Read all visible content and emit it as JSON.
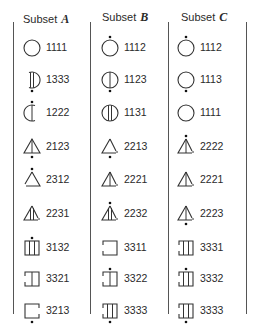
{
  "columns": [
    {
      "label": "Subset",
      "letter": "A",
      "x": 22,
      "items": [
        {
          "code": "1111",
          "shape": "circle",
          "lines": 0,
          "dot": "none",
          "gap": "none"
        },
        {
          "code": "1333",
          "shape": "circle",
          "lines": 2,
          "dot": "bottom",
          "gap": "left"
        },
        {
          "code": "1222",
          "shape": "circle",
          "lines": 1,
          "dot": "top",
          "gap": "right"
        },
        {
          "code": "2123",
          "shape": "triangle",
          "lines": 1,
          "dot": "bottom",
          "gap": "none"
        },
        {
          "code": "2312",
          "shape": "triangle",
          "lines": 0,
          "dot": "top",
          "gap": "left"
        },
        {
          "code": "2231",
          "shape": "triangle",
          "lines": 2,
          "dot": "none",
          "gap": "right"
        },
        {
          "code": "3132",
          "shape": "square",
          "lines": 2,
          "dot": "top",
          "gap": "none"
        },
        {
          "code": "3321",
          "shape": "square",
          "lines": 1,
          "dot": "none",
          "gap": "left"
        },
        {
          "code": "3213",
          "shape": "square",
          "lines": 0,
          "dot": "bottom",
          "gap": "right"
        }
      ]
    },
    {
      "label": "Subset",
      "letter": "B",
      "x": 100,
      "items": [
        {
          "code": "1112",
          "shape": "circle",
          "lines": 0,
          "dot": "top",
          "gap": "none"
        },
        {
          "code": "1123",
          "shape": "circle",
          "lines": 1,
          "dot": "bottom",
          "gap": "none"
        },
        {
          "code": "1131",
          "shape": "circle",
          "lines": 2,
          "dot": "none",
          "gap": "none"
        },
        {
          "code": "2213",
          "shape": "triangle",
          "lines": 0,
          "dot": "bottom",
          "gap": "right"
        },
        {
          "code": "2221",
          "shape": "triangle",
          "lines": 1,
          "dot": "none",
          "gap": "right"
        },
        {
          "code": "2232",
          "shape": "triangle",
          "lines": 2,
          "dot": "top",
          "gap": "right"
        },
        {
          "code": "3311",
          "shape": "square",
          "lines": 0,
          "dot": "none",
          "gap": "left"
        },
        {
          "code": "3322",
          "shape": "square",
          "lines": 1,
          "dot": "top",
          "gap": "left"
        },
        {
          "code": "3333",
          "shape": "square",
          "lines": 2,
          "dot": "bottom",
          "gap": "left"
        }
      ]
    },
    {
      "label": "Subset",
      "letter": "C",
      "x": 176,
      "items": [
        {
          "code": "1112",
          "shape": "circle",
          "lines": 0,
          "dot": "top",
          "gap": "none"
        },
        {
          "code": "1113",
          "shape": "circle",
          "lines": 0,
          "dot": "bottom",
          "gap": "none"
        },
        {
          "code": "1111",
          "shape": "circle",
          "lines": 0,
          "dot": "none",
          "gap": "none"
        },
        {
          "code": "2222",
          "shape": "triangle",
          "lines": 1,
          "dot": "top",
          "gap": "right"
        },
        {
          "code": "2221",
          "shape": "triangle",
          "lines": 1,
          "dot": "none",
          "gap": "right"
        },
        {
          "code": "2223",
          "shape": "triangle",
          "lines": 1,
          "dot": "bottom",
          "gap": "right"
        },
        {
          "code": "3331",
          "shape": "square",
          "lines": 2,
          "dot": "none",
          "gap": "left"
        },
        {
          "code": "3332",
          "shape": "square",
          "lines": 2,
          "dot": "top",
          "gap": "left"
        },
        {
          "code": "3333",
          "shape": "square",
          "lines": 2,
          "dot": "bottom",
          "gap": "left"
        }
      ]
    }
  ],
  "row_y": [
    33,
    65,
    98,
    132,
    165,
    199,
    233,
    264,
    296
  ]
}
